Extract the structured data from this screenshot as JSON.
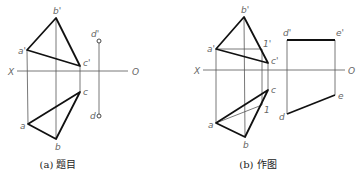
{
  "panels": [
    {
      "id": "a",
      "caption": "(a) 题目",
      "axis": {
        "left_label": "X",
        "right_label": "O"
      },
      "points": {
        "b_prime": "b'",
        "a_prime": "a'",
        "c_prime": "c'",
        "d_prime": "d'",
        "a": "a",
        "b": "b",
        "c": "c",
        "d": "d"
      }
    },
    {
      "id": "b",
      "caption": "(b) 作图",
      "axis": {
        "left_label": "X",
        "right_label": "O"
      },
      "points": {
        "b_prime": "b'",
        "a_prime": "a'",
        "c_prime": "c'",
        "one_prime": "1'",
        "d_prime": "d'",
        "e_prime": "e'",
        "a": "a",
        "b": "b",
        "c": "c",
        "one": "1",
        "d": "d",
        "e": "e"
      }
    }
  ]
}
